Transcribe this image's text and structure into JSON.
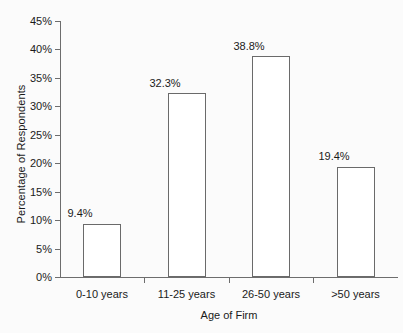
{
  "chart_data": {
    "type": "bar",
    "title": "",
    "subtitle": "",
    "xlabel": "Age of Firm",
    "ylabel": "Percentage of Respondents",
    "categories": [
      "0-10 years",
      "11-25 years",
      "26-50 years",
      ">50 years"
    ],
    "values": [
      9.4,
      32.3,
      38.8,
      19.4
    ],
    "data_labels": [
      "9.4%",
      "32.3%",
      "38.8%",
      "19.4%"
    ],
    "ylim": [
      0,
      45
    ],
    "ytick_values": [
      0,
      5,
      10,
      15,
      20,
      25,
      30,
      35,
      40,
      45
    ],
    "ytick_labels": [
      "0%",
      "5%",
      "10%",
      "15%",
      "20%",
      "25%",
      "30%",
      "35%",
      "40%",
      "45%"
    ],
    "grid": false,
    "legend": false,
    "legend_position": "none",
    "series": [
      {
        "name": "Percentage of Respondents",
        "values": [
          9.4,
          32.3,
          38.8,
          19.4
        ]
      }
    ],
    "colors": {
      "bar_fill": "#ffffff",
      "bar_outline": "#6a6a6a",
      "axis": "#6d6d6d",
      "text": "#1a1a1a",
      "background": "#fbfbfb"
    }
  }
}
